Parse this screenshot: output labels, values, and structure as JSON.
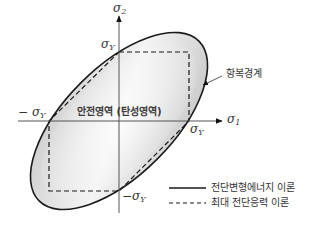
{
  "diagram": {
    "axes": {
      "x_symbol": "σ",
      "x_sub": "1",
      "y_symbol": "σ",
      "y_sub": "2"
    },
    "tick_labels": {
      "top": {
        "symbol": "σ",
        "sub": "Y",
        "sign": ""
      },
      "right": {
        "symbol": "σ",
        "sub": "Y",
        "sign": ""
      },
      "left": {
        "symbol": "σ",
        "sub": "Y",
        "sign": "−"
      },
      "bottom": {
        "symbol": "σ",
        "sub": "Y",
        "sign": "−"
      }
    },
    "callout": "항복경계",
    "center_label": "안전영역 (탄성영역)",
    "legend": [
      {
        "style": "solid",
        "label": "전단변형에너지 이론"
      },
      {
        "style": "dashed",
        "label": "최대 전단응력 이론"
      }
    ],
    "colors": {
      "line": "#1a1a1a",
      "axis": "#555555",
      "fill_light": "#f2f2f2",
      "fill_dark": "#b8b8b8"
    }
  }
}
